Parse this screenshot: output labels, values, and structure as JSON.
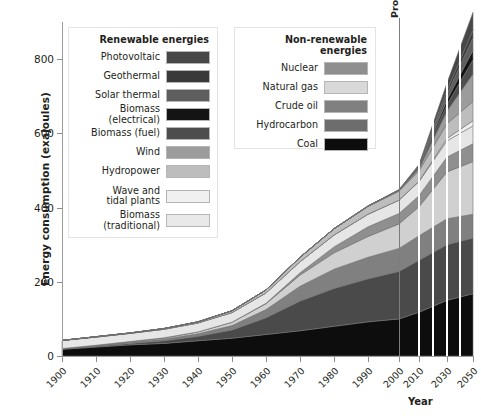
{
  "chart_data": {
    "type": "area",
    "title": "",
    "xlabel": "Year",
    "ylabel": "Energy consumption (exajoules)",
    "ylim": [
      0,
      900
    ],
    "yticks": [
      0,
      200,
      400,
      600,
      800
    ],
    "xlim": [
      1900,
      2050
    ],
    "xticks": [
      1900,
      1910,
      1920,
      1930,
      1940,
      1950,
      1960,
      1970,
      1980,
      1990,
      2000,
      2010,
      2030,
      2050
    ],
    "grid": false,
    "legend_position": "inside-top",
    "annotations": [
      {
        "text": "Projected",
        "x": 2005,
        "orientation": "vertical"
      }
    ],
    "x": [
      1900,
      1910,
      1920,
      1930,
      1940,
      1950,
      1960,
      1970,
      1980,
      1990,
      2000,
      2010,
      2030,
      2050
    ],
    "stack_order_bottom_to_top": [
      "Coal",
      "Hydrocarbon",
      "Crude oil",
      "Natural gas",
      "Nuclear",
      "Biomass (traditional)",
      "Wave and tidal plants",
      "Hydropower",
      "Wind",
      "Biomass (fuel)",
      "Biomass (electrical)",
      "Solar thermal",
      "Geothermal",
      "Photovoltaic"
    ],
    "series": [
      {
        "name": "Coal",
        "color": "#0d0d0d",
        "values": [
          18,
          24,
          30,
          34,
          41,
          48,
          58,
          68,
          80,
          92,
          100,
          118,
          150,
          168
        ]
      },
      {
        "name": "Hydrocarbon",
        "color": "#4a4a4a",
        "values": [
          1,
          2,
          4,
          7,
          12,
          22,
          45,
          80,
          102,
          116,
          128,
          140,
          150,
          150
        ]
      },
      {
        "name": "Crude oil",
        "color": "#808080",
        "values": [
          1,
          2,
          3,
          5,
          7,
          12,
          22,
          40,
          52,
          58,
          62,
          66,
          70,
          64
        ]
      },
      {
        "name": "Natural gas",
        "color": "#d0d0d0",
        "values": [
          0,
          1,
          2,
          3,
          5,
          9,
          16,
          30,
          44,
          56,
          66,
          78,
          126,
          142
        ]
      },
      {
        "name": "Nuclear",
        "color": "#8f8f8f",
        "values": [
          0,
          0,
          0,
          0,
          0,
          0,
          1,
          6,
          16,
          26,
          28,
          30,
          40,
          48
        ]
      },
      {
        "name": "Biomass (traditional)",
        "color": "#e6e6e6",
        "values": [
          22,
          22,
          22,
          23,
          24,
          26,
          28,
          30,
          32,
          34,
          36,
          38,
          44,
          48
        ]
      },
      {
        "name": "Wave and tidal plants",
        "color": "#f0f0f0",
        "values": [
          0,
          0,
          0,
          0,
          0,
          0,
          0,
          0,
          0,
          0,
          0,
          1,
          6,
          14
        ]
      },
      {
        "name": "Hydropower",
        "color": "#bdbdbd",
        "values": [
          0,
          1,
          1,
          2,
          3,
          5,
          8,
          12,
          17,
          21,
          24,
          28,
          40,
          52
        ]
      },
      {
        "name": "Wind",
        "color": "#9c9c9c",
        "values": [
          0,
          0,
          0,
          0,
          0,
          0,
          0,
          0,
          0,
          1,
          2,
          6,
          34,
          74
        ]
      },
      {
        "name": "Biomass (fuel)",
        "color": "#4d4d4d",
        "values": [
          0,
          0,
          0,
          0,
          0,
          0,
          0,
          0,
          0,
          0,
          1,
          3,
          18,
          38
        ]
      },
      {
        "name": "Biomass (electrical)",
        "color": "#141414",
        "values": [
          0,
          0,
          0,
          0,
          0,
          0,
          0,
          0,
          0,
          0,
          0,
          2,
          12,
          26
        ]
      },
      {
        "name": "Solar thermal",
        "color": "#5e5e5e",
        "values": [
          0,
          0,
          0,
          0,
          0,
          0,
          0,
          0,
          0,
          0,
          0,
          2,
          16,
          34
        ]
      },
      {
        "name": "Geothermal",
        "color": "#3a3a3a",
        "values": [
          0,
          0,
          0,
          0,
          0,
          0,
          0,
          0,
          0,
          0,
          1,
          2,
          10,
          20
        ]
      },
      {
        "name": "Photovoltaic",
        "color": "#474747",
        "values": [
          0,
          0,
          0,
          0,
          0,
          0,
          0,
          0,
          0,
          0,
          0,
          2,
          20,
          48
        ]
      }
    ]
  },
  "axes": {
    "ylabel": "Energy consumption (exajoules)",
    "xlabel": "Year",
    "yticks": [
      "0",
      "200",
      "400",
      "600",
      "800"
    ],
    "xticks": [
      "1900",
      "1910",
      "1920",
      "1930",
      "1940",
      "1950",
      "1960",
      "1970",
      "1980",
      "1990",
      "2000",
      "2010",
      "2030",
      "2050"
    ]
  },
  "annotation": {
    "projected": "Projected"
  },
  "legends": {
    "renewable": {
      "title": "Renewable energies",
      "items": [
        {
          "label": "Photovoltaic",
          "color": "#474747"
        },
        {
          "label": "Geothermal",
          "color": "#3a3a3a"
        },
        {
          "label": "Solar thermal",
          "color": "#5e5e5e"
        },
        {
          "label": "Biomass (electrical)",
          "color": "#141414"
        },
        {
          "label": "Biomass (fuel)",
          "color": "#4d4d4d"
        },
        {
          "label": "Wind",
          "color": "#9c9c9c"
        },
        {
          "label": "Hydropower",
          "color": "#bdbdbd"
        },
        {
          "label": "Wave and\ntidal plants",
          "color": "#f0f0f0"
        },
        {
          "label": "Biomass (traditional)",
          "color": "#e9e9e9"
        }
      ]
    },
    "nonrenewable": {
      "title": "Non-renewable energies",
      "items": [
        {
          "label": "Nuclear",
          "color": "#8f8f8f"
        },
        {
          "label": "Natural gas",
          "color": "#d8d8d8"
        },
        {
          "label": "Crude oil",
          "color": "#808080"
        },
        {
          "label": "Hydrocarbon",
          "color": "#6d6d6d"
        },
        {
          "label": "Coal",
          "color": "#0d0d0d"
        }
      ]
    }
  }
}
